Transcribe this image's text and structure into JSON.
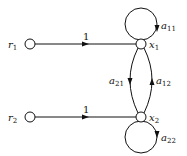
{
  "diagram": {
    "type": "signal-flow-graph",
    "nodes": [
      {
        "id": "r1",
        "label": "r",
        "sub": "1"
      },
      {
        "id": "x1",
        "label": "x",
        "sub": "1"
      },
      {
        "id": "r2",
        "label": "r",
        "sub": "2"
      },
      {
        "id": "x2",
        "label": "x",
        "sub": "2"
      }
    ],
    "edges": [
      {
        "from": "r1",
        "to": "x1",
        "gain": "1"
      },
      {
        "from": "r2",
        "to": "x2",
        "gain": "1"
      },
      {
        "from": "x1",
        "to": "x2",
        "label": "a",
        "sub": "21"
      },
      {
        "from": "x2",
        "to": "x1",
        "label": "a",
        "sub": "12"
      },
      {
        "from": "x1",
        "to": "x1",
        "label": "a",
        "sub": "11"
      },
      {
        "from": "x2",
        "to": "x2",
        "label": "a",
        "sub": "22"
      }
    ]
  }
}
